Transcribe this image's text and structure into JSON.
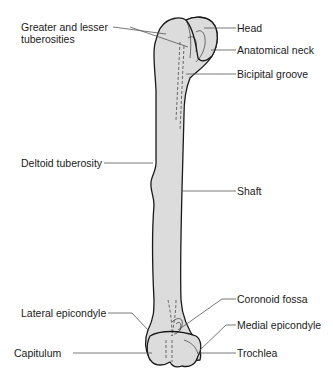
{
  "figure": {
    "colors": {
      "bone_fill": "#dcdcdc",
      "bone_outline": "#1a1a1a",
      "leader_line": "#555555",
      "text": "#1a1a1a",
      "background": "#ffffff"
    }
  },
  "labels": {
    "left": [
      {
        "id": "tuberosities",
        "text": "Greater and lesser tuberosities"
      },
      {
        "id": "deltoid",
        "text": "Deltoid tuberosity"
      },
      {
        "id": "lateral_epicondyle",
        "text": "Lateral epicondyle"
      },
      {
        "id": "capitulum",
        "text": "Capitulum"
      }
    ],
    "right": [
      {
        "id": "head",
        "text": "Head"
      },
      {
        "id": "anatomical_neck",
        "text": "Anatomical neck"
      },
      {
        "id": "bicipital_groove",
        "text": "Bicipital groove"
      },
      {
        "id": "shaft",
        "text": "Shaft"
      },
      {
        "id": "coronoid_fossa",
        "text": "Coronoid fossa"
      },
      {
        "id": "medial_epicondyle",
        "text": "Medial epicondyle"
      },
      {
        "id": "trochlea",
        "text": "Trochlea"
      }
    ]
  }
}
